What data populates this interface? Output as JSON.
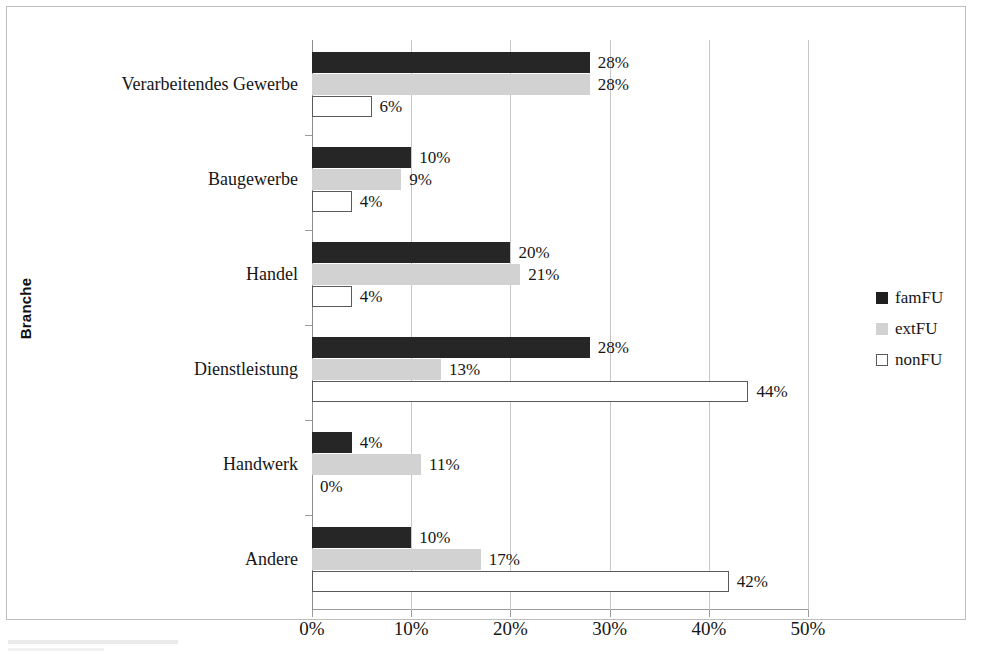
{
  "chart_data": {
    "type": "bar",
    "orientation": "horizontal",
    "title": "",
    "xlabel": "",
    "ylabel": "Branche",
    "xlim": [
      0,
      50
    ],
    "xtick_labels": [
      "0%",
      "10%",
      "20%",
      "30%",
      "40%",
      "50%"
    ],
    "xticks": [
      0,
      10,
      20,
      30,
      40,
      50
    ],
    "grid": true,
    "legend_position": "right",
    "value_suffix": "%",
    "categories": [
      "Verarbeitendes Gewerbe",
      "Baugewerbe",
      "Handel",
      "Dienstleistung",
      "Handwerk",
      "Andere"
    ],
    "series": [
      {
        "name": "famFU",
        "color": "#262626",
        "values": [
          28,
          10,
          20,
          28,
          4,
          10
        ],
        "labels": [
          "28%",
          "10%",
          "20%",
          "28%",
          "4%",
          "10%"
        ]
      },
      {
        "name": "extFU",
        "color": "#d2d2d2",
        "values": [
          28,
          9,
          21,
          13,
          11,
          17
        ],
        "labels": [
          "28%",
          "9%",
          "21%",
          "13%",
          "11%",
          "17%"
        ]
      },
      {
        "name": "nonFU",
        "color": "#ffffff",
        "values": [
          6,
          4,
          4,
          44,
          0,
          42
        ],
        "labels": [
          "6%",
          "4%",
          "4%",
          "44%",
          "0%",
          "42%"
        ]
      }
    ]
  },
  "legend": {
    "items": [
      {
        "label": "famFU",
        "key": "famFU"
      },
      {
        "label": "extFU",
        "key": "extFU"
      },
      {
        "label": "nonFU",
        "key": "nonFU"
      }
    ]
  },
  "axis": {
    "y_title": "Branche"
  }
}
